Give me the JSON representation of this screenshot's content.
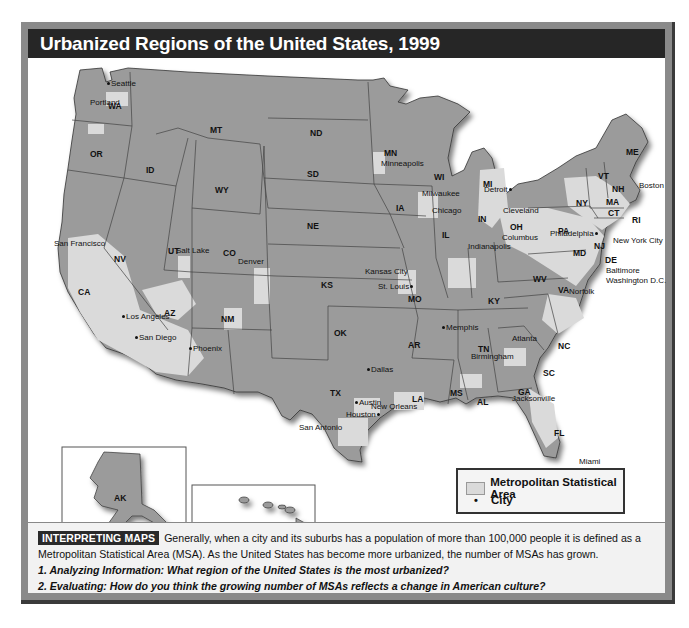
{
  "title": "Urbanized Regions of the United States, 1999",
  "colors": {
    "frame": "#8a8a8a",
    "title_bar": "#262626",
    "state_fill": "#9b9b9b",
    "msa_fill": "#dadada",
    "state_border": "#444444",
    "caption_bg": "#f2f2f2"
  },
  "map": {
    "states": [
      {
        "abbr": "WA",
        "x": 80,
        "y": 43
      },
      {
        "abbr": "OR",
        "x": 62,
        "y": 91
      },
      {
        "abbr": "CA",
        "x": 50,
        "y": 229
      },
      {
        "abbr": "ID",
        "x": 118,
        "y": 107
      },
      {
        "abbr": "NV",
        "x": 86,
        "y": 196
      },
      {
        "abbr": "MT",
        "x": 182,
        "y": 67
      },
      {
        "abbr": "WY",
        "x": 187,
        "y": 127
      },
      {
        "abbr": "UT",
        "x": 140,
        "y": 188
      },
      {
        "abbr": "AZ",
        "x": 136,
        "y": 223
      },
      {
        "abbr": "CO",
        "x": 195,
        "y": 190
      },
      {
        "abbr": "NM",
        "x": 193,
        "y": 234
      },
      {
        "abbr": "ND",
        "x": 282,
        "y": 70
      },
      {
        "abbr": "SD",
        "x": 279,
        "y": 111
      },
      {
        "abbr": "NE",
        "x": 279,
        "y": 167
      },
      {
        "abbr": "KS",
        "x": 293,
        "y": 207
      },
      {
        "abbr": "OK",
        "x": 306,
        "y": 225
      },
      {
        "abbr": "TX",
        "x": 305,
        "y": 284
      },
      {
        "abbr": "MN",
        "x": 356,
        "y": 92
      },
      {
        "abbr": "IA",
        "x": 368,
        "y": 145
      },
      {
        "abbr": "MO",
        "x": 380,
        "y": 236
      },
      {
        "abbr": "AR",
        "x": 380,
        "y": 256
      },
      {
        "abbr": "LA",
        "x": 384,
        "y": 297
      },
      {
        "abbr": "WI",
        "x": 406,
        "y": 116
      },
      {
        "abbr": "IL",
        "x": 414,
        "y": 183
      },
      {
        "abbr": "MS",
        "x": 422,
        "y": 285
      },
      {
        "abbr": "MI",
        "x": 455,
        "y": 125
      },
      {
        "abbr": "IN",
        "x": 450,
        "y": 160
      },
      {
        "abbr": "KY",
        "x": 460,
        "y": 240
      },
      {
        "abbr": "TN",
        "x": 456,
        "y": 262
      },
      {
        "abbr": "AL",
        "x": 453,
        "y": 306
      },
      {
        "abbr": "OH",
        "x": 482,
        "y": 168
      },
      {
        "abbr": "GA",
        "x": 490,
        "y": 303
      },
      {
        "abbr": "FL",
        "x": 526,
        "y": 362
      },
      {
        "abbr": "SC",
        "x": 515,
        "y": 282
      },
      {
        "abbr": "NC",
        "x": 530,
        "y": 255
      },
      {
        "abbr": "VA",
        "x": 530,
        "y": 231
      },
      {
        "abbr": "WV",
        "x": 505,
        "y": 216
      },
      {
        "abbr": "PA",
        "x": 530,
        "y": 170
      },
      {
        "abbr": "NY",
        "x": 548,
        "y": 143
      },
      {
        "abbr": "VT",
        "x": 570,
        "y": 121
      },
      {
        "abbr": "NH",
        "x": 584,
        "y": 129
      },
      {
        "abbr": "ME",
        "x": 600,
        "y": 92
      },
      {
        "abbr": "MA",
        "x": 580,
        "y": 142
      },
      {
        "abbr": "CT",
        "x": 582,
        "y": 154
      },
      {
        "abbr": "RI",
        "x": 606,
        "y": 161
      },
      {
        "abbr": "NJ",
        "x": 568,
        "y": 186
      },
      {
        "abbr": "MD",
        "x": 545,
        "y": 193
      },
      {
        "abbr": "DE",
        "x": 577,
        "y": 201
      },
      {
        "abbr": "AK",
        "x": 88,
        "y": 441
      },
      {
        "abbr": "HI",
        "x": 280,
        "y": 487
      }
    ],
    "cities": [
      {
        "name": "Seattle",
        "x": 83,
        "y": 31,
        "dot": "left"
      },
      {
        "name": "Portland",
        "x": 63,
        "y": 64,
        "dot": "above"
      },
      {
        "name": "San Francisco",
        "x": 39,
        "y": 205,
        "dot": "left"
      },
      {
        "name": "Los Angeles",
        "x": 77,
        "y": 256,
        "dot": "left"
      },
      {
        "name": "San Diego",
        "x": 80,
        "y": 279,
        "dot": "left"
      },
      {
        "name": "Phoenix",
        "x": 159,
        "y": 288,
        "dot": "left"
      },
      {
        "name": "Salt Lake",
        "x": 172,
        "y": 217,
        "dot": "above"
      },
      {
        "name": "Denver",
        "x": 235,
        "y": 228,
        "dot": "below"
      },
      {
        "name": "Minneapolis",
        "x": 355,
        "y": 104,
        "dot": "above"
      },
      {
        "name": "Milwaukee",
        "x": 395,
        "y": 161,
        "dot": "right"
      },
      {
        "name": "Chicago",
        "x": 399,
        "y": 209,
        "dot": "right"
      },
      {
        "name": "Detroit",
        "x": 456,
        "y": 186,
        "dot": "right"
      },
      {
        "name": "Kansas City",
        "x": 362,
        "y": 240,
        "dot": "below"
      },
      {
        "name": "St. Louis",
        "x": 378,
        "y": 253,
        "dot": "right"
      },
      {
        "name": "Indianapolis",
        "x": 441,
        "y": 239,
        "dot": "above"
      },
      {
        "name": "Cleveland",
        "x": 475,
        "y": 204,
        "dot": "above"
      },
      {
        "name": "Columbus",
        "x": 473,
        "y": 228,
        "dot": "above"
      },
      {
        "name": "Philadelphia",
        "x": 520,
        "y": 208,
        "dot": "right"
      },
      {
        "name": "New York City",
        "x": 586,
        "y": 209
      },
      {
        "name": "Boston",
        "x": 612,
        "y": 158
      },
      {
        "name": "Baltimore",
        "x": 578,
        "y": 238
      },
      {
        "name": "Washington D.C.",
        "x": 578,
        "y": 248
      },
      {
        "name": "Norfolk",
        "x": 548,
        "y": 258
      },
      {
        "name": "Memphis",
        "x": 418,
        "y": 295,
        "dot": "left"
      },
      {
        "name": "Atlanta",
        "x": 484,
        "y": 306,
        "dot": "below"
      },
      {
        "name": "Birmingham",
        "x": 441,
        "y": 325,
        "dot": "above"
      },
      {
        "name": "Dallas",
        "x": 344,
        "y": 337,
        "dot": "left"
      },
      {
        "name": "Austin",
        "x": 330,
        "y": 370,
        "dot": "left"
      },
      {
        "name": "Houston",
        "x": 327,
        "y": 381,
        "dot": "right"
      },
      {
        "name": "San Antonio",
        "x": 300,
        "y": 393,
        "dot": "above"
      },
      {
        "name": "New Orleans",
        "x": 373,
        "y": 375,
        "dot": "right"
      },
      {
        "name": "Jacksonville",
        "x": 488,
        "y": 365,
        "dot": "right"
      },
      {
        "name": "Miami",
        "x": 553,
        "y": 428
      }
    ]
  },
  "legend": {
    "items": [
      {
        "label": "Metropolitan Statistical Area",
        "symbol": "msa-swatch"
      },
      {
        "label": "City",
        "symbol": "city-dot",
        "glyph": "•"
      }
    ]
  },
  "caption": {
    "badge": "INTERPRETING MAPS",
    "text": "Generally, when a city and its suburbs has a population of more than 100,000 people it is defined as a Metropolitan Statistical Area (MSA). As the United States has become more urbanized, the number of MSAs has grown.",
    "questions": [
      "1. Analyzing Information: What region of the United States is the most urbanized?",
      "2. Evaluating: How do you think the growing number of MSAs reflects a change in American culture?"
    ]
  }
}
